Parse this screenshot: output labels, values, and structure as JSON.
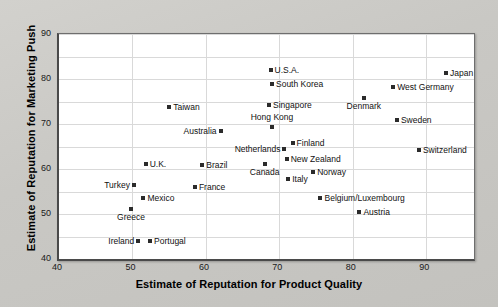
{
  "chart_data": {
    "type": "scatter",
    "title": "",
    "xlabel": "Estimate of Reputation for Product Quality",
    "ylabel": "Estimate of Reputation for Marketing Push",
    "xlim": [
      40,
      96.5
    ],
    "ylim": [
      40,
      90
    ],
    "xticks": [
      40,
      50,
      60,
      70,
      80,
      90
    ],
    "yticks": [
      40,
      50,
      60,
      70,
      80,
      90
    ],
    "grid": true,
    "legend": "none",
    "marker_color": "#2b2b2b",
    "points": [
      {
        "label": "Japan",
        "x": 92.7,
        "y": 81.3,
        "pos": "right"
      },
      {
        "label": "U.S.A.",
        "x": 68.8,
        "y": 82.0,
        "pos": "right"
      },
      {
        "label": "South Korea",
        "x": 69.0,
        "y": 79.0,
        "pos": "right"
      },
      {
        "label": "West Germany",
        "x": 85.5,
        "y": 78.2,
        "pos": "right"
      },
      {
        "label": "Denmark",
        "x": 81.5,
        "y": 75.8,
        "pos": "below"
      },
      {
        "label": "Singapore",
        "x": 68.6,
        "y": 74.2,
        "pos": "right"
      },
      {
        "label": "Taiwan",
        "x": 55.0,
        "y": 73.8,
        "pos": "right"
      },
      {
        "label": "Sweden",
        "x": 86.0,
        "y": 70.9,
        "pos": "right"
      },
      {
        "label": "Hong Kong",
        "x": 69.0,
        "y": 69.3,
        "pos": "above"
      },
      {
        "label": "Australia",
        "x": 62.0,
        "y": 68.4,
        "pos": "left"
      },
      {
        "label": "Finland",
        "x": 71.8,
        "y": 65.8,
        "pos": "right"
      },
      {
        "label": "Netherlands",
        "x": 70.7,
        "y": 64.4,
        "pos": "left"
      },
      {
        "label": "Switzerland",
        "x": 89.0,
        "y": 64.2,
        "pos": "right"
      },
      {
        "label": "New Zealand",
        "x": 71.0,
        "y": 62.2,
        "pos": "right"
      },
      {
        "label": "Canada",
        "x": 68.0,
        "y": 61.1,
        "pos": "below"
      },
      {
        "label": "U.K.",
        "x": 51.8,
        "y": 61.1,
        "pos": "right"
      },
      {
        "label": "Brazil",
        "x": 59.5,
        "y": 60.9,
        "pos": "right"
      },
      {
        "label": "Norway",
        "x": 74.6,
        "y": 59.3,
        "pos": "right"
      },
      {
        "label": "Italy",
        "x": 71.2,
        "y": 57.8,
        "pos": "right"
      },
      {
        "label": "Turkey",
        "x": 50.2,
        "y": 56.4,
        "pos": "left"
      },
      {
        "label": "France",
        "x": 58.5,
        "y": 56.0,
        "pos": "right"
      },
      {
        "label": "Belgium/Luxembourg",
        "x": 75.6,
        "y": 53.6,
        "pos": "right"
      },
      {
        "label": "Mexico",
        "x": 51.5,
        "y": 53.6,
        "pos": "right"
      },
      {
        "label": "Austria",
        "x": 80.9,
        "y": 50.4,
        "pos": "right"
      },
      {
        "label": "Greece",
        "x": 49.8,
        "y": 51.1,
        "pos": "below"
      },
      {
        "label": "Ireland",
        "x": 50.8,
        "y": 44.0,
        "pos": "left"
      },
      {
        "label": "Portugal",
        "x": 52.4,
        "y": 44.0,
        "pos": "right"
      }
    ]
  }
}
